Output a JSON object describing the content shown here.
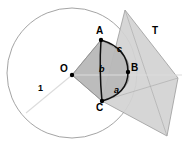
{
  "figure": {
    "background": "#ffffff"
  },
  "colors": {
    "circle_stroke": "#9a9a9a",
    "plane_fill": "#d2d2d2",
    "plane_stroke": "#9a9a9a",
    "sector_fill": "#b8b8b8",
    "sector_stroke": "#8f8f8f",
    "radius_line": "#dcdcdc",
    "arc_stroke": "#111111",
    "chord_stroke": "#111111",
    "point_fill": "#000000",
    "label_color": "#000000"
  },
  "geometry": {
    "circle": {
      "cx": 72,
      "cy": 73,
      "r": 65
    },
    "points": {
      "O": {
        "x": 72,
        "y": 75
      },
      "A": {
        "x": 101,
        "y": 40
      },
      "B": {
        "x": 128,
        "y": 72
      },
      "C": {
        "x": 102,
        "y": 101
      }
    },
    "plane_polygon": [
      {
        "x": 125,
        "y": 10
      },
      {
        "x": 178,
        "y": 78
      },
      {
        "x": 167,
        "y": 136
      },
      {
        "x": 102,
        "y": 101
      }
    ],
    "radius_line": {
      "x1": 72,
      "y1": 75,
      "x2": 26,
      "y2": 113
    },
    "center_line": {
      "x1": 72,
      "y1": 75,
      "x2": 182,
      "y2": 75
    }
  },
  "labels": {
    "point_O": "O",
    "point_A": "A",
    "point_B": "B",
    "point_C": "C",
    "side_a": "a",
    "side_b": "b",
    "side_c": "c",
    "plane_T": "T",
    "radius_one": "1"
  },
  "label_positions": {
    "point_O": {
      "x": 60,
      "y": 64
    },
    "point_A": {
      "x": 96,
      "y": 26
    },
    "point_B": {
      "x": 131,
      "y": 63
    },
    "point_C": {
      "x": 96,
      "y": 103
    },
    "side_a": {
      "x": 114,
      "y": 86
    },
    "side_b": {
      "x": 99,
      "y": 65
    },
    "side_c": {
      "x": 117,
      "y": 45
    },
    "plane_T": {
      "x": 152,
      "y": 26
    },
    "radius_one": {
      "x": 38,
      "y": 84
    }
  }
}
